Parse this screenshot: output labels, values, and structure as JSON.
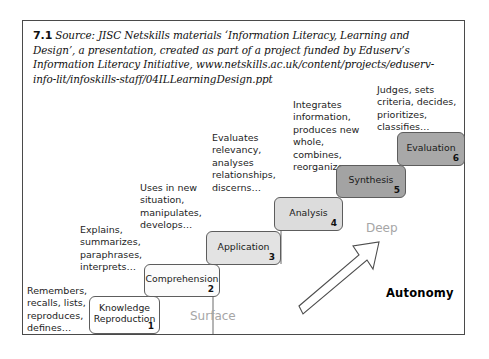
{
  "figure": {
    "caption_number": "7.1",
    "caption_text": "Source: JISC Netskills materials ‘Information Literacy, Learning and Design’, a presentation, created as part of a project funded by Eduserv’s Information Literacy Initiative, www.netskills.ac.uk/content/projects/eduserv-info-lit/infoskills-staff/04ILLearningDesign.ppt"
  },
  "diagram": {
    "type": "staircase",
    "steps": [
      {
        "number": "1",
        "label": "Knowledge\nReproduction",
        "descriptor": "Remembers, recalls, lists, reproduces, defines…",
        "fill": "#ffffff"
      },
      {
        "number": "2",
        "label": "Comprehension",
        "descriptor": "Explains, summarizes, paraphrases, interprets…",
        "fill": "#fbfbfb"
      },
      {
        "number": "3",
        "label": "Application",
        "descriptor": "Uses in new situation, manipulates, develops…",
        "fill": "#e3e3e3"
      },
      {
        "number": "4",
        "label": "Analysis",
        "descriptor": "Evaluates relevancy, analyses relationships, discerns…",
        "fill": "#dcdcdc"
      },
      {
        "number": "5",
        "label": "Synthesis",
        "descriptor": "Integrates information, produces new whole, combines, reorganizes…",
        "fill": "#a3a3a3"
      },
      {
        "number": "6",
        "label": "Evaluation",
        "descriptor": "Judges, sets criteria, decides, prioritizes, classifies…",
        "fill": "#a8a8a8"
      }
    ],
    "region_labels": {
      "surface": "Surface",
      "deep": "Deep"
    },
    "axis_label": "Autonomy",
    "colors": {
      "region_label": "#a6a6a6",
      "box_border": "#5d5d5d",
      "frame_border": "#4a4a4a",
      "text": "#1d1d1d"
    }
  }
}
